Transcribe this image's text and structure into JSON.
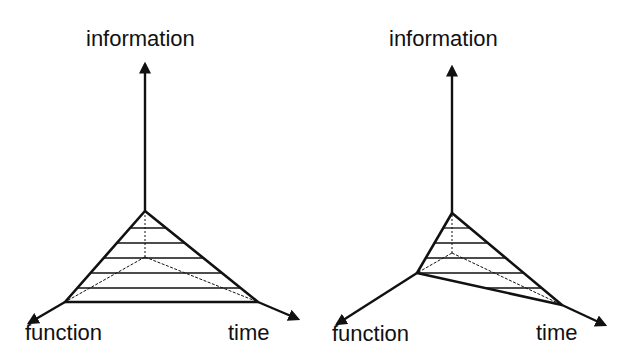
{
  "diagrams": [
    {
      "id": "left",
      "labels": {
        "information": "information",
        "function": "function",
        "time": "time"
      },
      "geometry": {
        "origin": [
          145,
          257
        ],
        "apex": [
          145,
          211
        ],
        "info_tip": [
          145,
          64
        ],
        "function_point": [
          65,
          302
        ],
        "function_tip": [
          29,
          323
        ],
        "time_point": [
          258,
          302
        ],
        "time_tip": [
          298,
          319
        ],
        "hatch_y": [
          228,
          243,
          258,
          273,
          288
        ]
      }
    },
    {
      "id": "right",
      "labels": {
        "information": "information",
        "function": "function",
        "time": "time"
      },
      "geometry": {
        "origin": [
          452,
          253
        ],
        "apex": [
          452,
          213
        ],
        "info_tip": [
          452,
          67
        ],
        "function_point": [
          417,
          273
        ],
        "function_tip": [
          337,
          324
        ],
        "time_point": [
          562,
          305
        ],
        "time_tip": [
          605,
          325
        ],
        "hatch_y": [
          228,
          243,
          258,
          273,
          288
        ]
      }
    }
  ],
  "colors": {
    "line": "#111111",
    "background": "#ffffff"
  }
}
